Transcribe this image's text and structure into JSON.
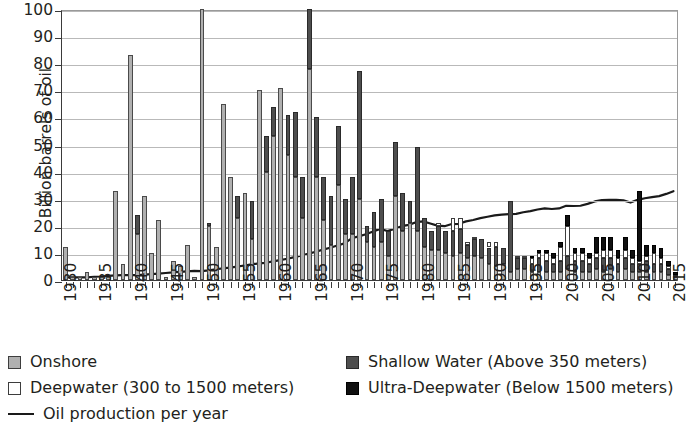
{
  "chart_data": {
    "type": "bar",
    "title": "",
    "subtitle": "",
    "xlabel": "",
    "ylabel": "Billion barrels of oil",
    "ylim": [
      0,
      100
    ],
    "ytick_values": [
      0,
      10,
      20,
      30,
      40,
      50,
      60,
      70,
      80,
      90,
      100
    ],
    "ytick_labels": [
      "0",
      "10",
      "20",
      "30",
      "40",
      "50",
      "60",
      "70",
      "80",
      "90",
      "100"
    ],
    "grid": true,
    "stacked": true,
    "legend_position": "below",
    "xtick_labels": [
      "1930",
      "1935",
      "1940",
      "1945",
      "1950",
      "1955",
      "1960",
      "1965",
      "1970",
      "1975",
      "1980",
      "1985",
      "1990",
      "1995",
      "2000",
      "2005",
      "2010",
      "2015"
    ],
    "x": [
      1930,
      1931,
      1932,
      1933,
      1934,
      1935,
      1936,
      1937,
      1938,
      1939,
      1940,
      1941,
      1942,
      1943,
      1944,
      1945,
      1946,
      1947,
      1948,
      1949,
      1950,
      1951,
      1952,
      1953,
      1954,
      1955,
      1956,
      1957,
      1958,
      1959,
      1960,
      1961,
      1962,
      1963,
      1964,
      1965,
      1966,
      1967,
      1968,
      1969,
      1970,
      1971,
      1972,
      1973,
      1974,
      1975,
      1976,
      1977,
      1978,
      1979,
      1980,
      1981,
      1982,
      1983,
      1984,
      1985,
      1986,
      1987,
      1988,
      1989,
      1990,
      1991,
      1992,
      1993,
      1994,
      1995,
      1996,
      1997,
      1998,
      1999,
      2000,
      2001,
      2002,
      2003,
      2004,
      2005,
      2006,
      2007,
      2008,
      2009,
      2010,
      2011,
      2012,
      2013,
      2014,
      2015
    ],
    "series": [
      {
        "name": "Onshore",
        "color": "#b0b0b0",
        "values": [
          12,
          1.5,
          1.5,
          3,
          1.5,
          1.5,
          1.5,
          33,
          6,
          83,
          24,
          31,
          10,
          22,
          6,
          12,
          5,
          100,
          20,
          11,
          65,
          38,
          31,
          30,
          70,
          56,
          71,
          60,
          62,
          50,
          38,
          58,
          38,
          100,
          78,
          60,
          36,
          30,
          57,
          30,
          25,
          77,
          20,
          19,
          35,
          29,
          40,
          26,
          28,
          49,
          22,
          13,
          18,
          12,
          15,
          12,
          11,
          14,
          11,
          14,
          11,
          12,
          8,
          7,
          5,
          5,
          5,
          5,
          4,
          5,
          6,
          5,
          5,
          5,
          6,
          5,
          5,
          5,
          5,
          5,
          5,
          5,
          4,
          4,
          3,
          2
        ]
      },
      {
        "name": "Shallow Water (Above 350 meters)",
        "color": "#4e4e4e",
        "values": [
          0,
          0,
          0,
          0,
          0,
          0,
          0,
          0,
          0,
          0,
          0,
          0,
          0,
          0,
          0,
          0,
          0,
          0,
          0,
          0,
          0,
          0,
          0,
          0,
          0,
          0,
          0,
          0,
          0,
          0,
          0,
          0,
          0,
          0,
          0,
          0,
          0,
          0,
          0,
          0,
          0,
          0,
          0,
          0,
          0,
          0,
          0,
          0,
          0,
          0,
          0,
          0,
          0,
          0,
          0,
          0,
          0,
          0,
          0,
          0,
          0,
          0,
          0,
          0,
          0,
          0,
          0,
          0,
          0,
          0,
          0,
          0,
          0,
          0,
          0,
          0,
          0,
          0,
          0,
          0,
          0,
          0,
          0,
          0,
          0,
          0
        ]
      }
    ],
    "stack_order": [
      "Onshore",
      "Shallow Water (Above 350 meters)",
      "Deepwater (300 to 1500 meters)",
      "Ultra-Deepwater (Below 1500 meters)"
    ],
    "bars": [
      {
        "year": 1930,
        "onshore": 12,
        "shallow": 0,
        "deepwater": 0,
        "ultra": 0
      },
      {
        "year": 1931,
        "onshore": 1,
        "shallow": 0,
        "deepwater": 0,
        "ultra": 0
      },
      {
        "year": 1932,
        "onshore": 1,
        "shallow": 0,
        "deepwater": 0,
        "ultra": 0
      },
      {
        "year": 1933,
        "onshore": 3,
        "shallow": 0,
        "deepwater": 0,
        "ultra": 0
      },
      {
        "year": 1934,
        "onshore": 1,
        "shallow": 0,
        "deepwater": 0,
        "ultra": 0
      },
      {
        "year": 1935,
        "onshore": 1,
        "shallow": 0,
        "deepwater": 0,
        "ultra": 0
      },
      {
        "year": 1936,
        "onshore": 1,
        "shallow": 0,
        "deepwater": 0,
        "ultra": 0
      },
      {
        "year": 1937,
        "onshore": 33,
        "shallow": 0,
        "deepwater": 0,
        "ultra": 0
      },
      {
        "year": 1938,
        "onshore": 6,
        "shallow": 0,
        "deepwater": 0,
        "ultra": 0
      },
      {
        "year": 1939,
        "onshore": 83,
        "shallow": 0,
        "deepwater": 0,
        "ultra": 0
      },
      {
        "year": 1940,
        "onshore": 17,
        "shallow": 7,
        "deepwater": 0,
        "ultra": 0
      },
      {
        "year": 1941,
        "onshore": 31,
        "shallow": 0,
        "deepwater": 0,
        "ultra": 0
      },
      {
        "year": 1942,
        "onshore": 10,
        "shallow": 0,
        "deepwater": 0,
        "ultra": 0
      },
      {
        "year": 1943,
        "onshore": 22,
        "shallow": 0,
        "deepwater": 0,
        "ultra": 0
      },
      {
        "year": 1944,
        "onshore": 1,
        "shallow": 0,
        "deepwater": 0,
        "ultra": 0
      },
      {
        "year": 1945,
        "onshore": 7,
        "shallow": 0,
        "deepwater": 0,
        "ultra": 0
      },
      {
        "year": 1946,
        "onshore": 5,
        "shallow": 0,
        "deepwater": 0,
        "ultra": 0
      },
      {
        "year": 1947,
        "onshore": 13,
        "shallow": 0,
        "deepwater": 0,
        "ultra": 0
      },
      {
        "year": 1948,
        "onshore": 1,
        "shallow": 0,
        "deepwater": 0,
        "ultra": 0
      },
      {
        "year": 1949,
        "onshore": 100,
        "shallow": 0,
        "deepwater": 0,
        "ultra": 0
      },
      {
        "year": 1950,
        "onshore": 20,
        "shallow": 1,
        "deepwater": 0,
        "ultra": 0
      },
      {
        "year": 1951,
        "onshore": 12,
        "shallow": 0,
        "deepwater": 0,
        "ultra": 0
      },
      {
        "year": 1952,
        "onshore": 65,
        "shallow": 0,
        "deepwater": 0,
        "ultra": 0
      },
      {
        "year": 1953,
        "onshore": 38,
        "shallow": 0,
        "deepwater": 0,
        "ultra": 0
      },
      {
        "year": 1954,
        "onshore": 23,
        "shallow": 8,
        "deepwater": 0,
        "ultra": 0
      },
      {
        "year": 1955,
        "onshore": 32,
        "shallow": 0,
        "deepwater": 0,
        "ultra": 0
      },
      {
        "year": 1956,
        "onshore": 15,
        "shallow": 14,
        "deepwater": 0,
        "ultra": 0
      },
      {
        "year": 1957,
        "onshore": 70,
        "shallow": 0,
        "deepwater": 0,
        "ultra": 0
      },
      {
        "year": 1958,
        "onshore": 40,
        "shallow": 13,
        "deepwater": 0,
        "ultra": 0
      },
      {
        "year": 1959,
        "onshore": 53,
        "shallow": 11,
        "deepwater": 0,
        "ultra": 0
      },
      {
        "year": 1960,
        "onshore": 71,
        "shallow": 0,
        "deepwater": 0,
        "ultra": 0
      },
      {
        "year": 1961,
        "onshore": 46,
        "shallow": 15,
        "deepwater": 0,
        "ultra": 0
      },
      {
        "year": 1962,
        "onshore": 38,
        "shallow": 24,
        "deepwater": 0,
        "ultra": 0
      },
      {
        "year": 1963,
        "onshore": 23,
        "shallow": 15,
        "deepwater": 0,
        "ultra": 0
      },
      {
        "year": 1964,
        "onshore": 78,
        "shallow": 22,
        "deepwater": 0,
        "ultra": 0
      },
      {
        "year": 1965,
        "onshore": 38,
        "shallow": 22,
        "deepwater": 0,
        "ultra": 0
      },
      {
        "year": 1966,
        "onshore": 22,
        "shallow": 16,
        "deepwater": 0,
        "ultra": 0
      },
      {
        "year": 1967,
        "onshore": 13,
        "shallow": 18,
        "deepwater": 0,
        "ultra": 0
      },
      {
        "year": 1968,
        "onshore": 35,
        "shallow": 22,
        "deepwater": 0,
        "ultra": 0
      },
      {
        "year": 1969,
        "onshore": 17,
        "shallow": 13,
        "deepwater": 0,
        "ultra": 0
      },
      {
        "year": 1970,
        "onshore": 17,
        "shallow": 21,
        "deepwater": 0,
        "ultra": 0
      },
      {
        "year": 1971,
        "onshore": 30,
        "shallow": 47,
        "deepwater": 0,
        "ultra": 0
      },
      {
        "year": 1972,
        "onshore": 14,
        "shallow": 6,
        "deepwater": 0,
        "ultra": 0
      },
      {
        "year": 1973,
        "onshore": 12,
        "shallow": 13,
        "deepwater": 0,
        "ultra": 0
      },
      {
        "year": 1974,
        "onshore": 14,
        "shallow": 16,
        "deepwater": 0,
        "ultra": 0
      },
      {
        "year": 1975,
        "onshore": 9,
        "shallow": 9,
        "deepwater": 0,
        "ultra": 0
      },
      {
        "year": 1976,
        "onshore": 31,
        "shallow": 20,
        "deepwater": 0,
        "ultra": 0
      },
      {
        "year": 1977,
        "onshore": 18,
        "shallow": 14,
        "deepwater": 0,
        "ultra": 0
      },
      {
        "year": 1978,
        "onshore": 21,
        "shallow": 8,
        "deepwater": 0,
        "ultra": 0
      },
      {
        "year": 1979,
        "onshore": 18,
        "shallow": 31,
        "deepwater": 0,
        "ultra": 0
      },
      {
        "year": 1980,
        "onshore": 12,
        "shallow": 11,
        "deepwater": 0,
        "ultra": 0
      },
      {
        "year": 1981,
        "onshore": 11,
        "shallow": 7,
        "deepwater": 0,
        "ultra": 0
      },
      {
        "year": 1982,
        "onshore": 11,
        "shallow": 9,
        "deepwater": 1,
        "ultra": 0
      },
      {
        "year": 1983,
        "onshore": 10,
        "shallow": 8,
        "deepwater": 0,
        "ultra": 0
      },
      {
        "year": 1984,
        "onshore": 9,
        "shallow": 9,
        "deepwater": 5,
        "ultra": 0
      },
      {
        "year": 1985,
        "onshore": 10,
        "shallow": 9,
        "deepwater": 4,
        "ultra": 0
      },
      {
        "year": 1986,
        "onshore": 8,
        "shallow": 5,
        "deepwater": 1,
        "ultra": 0
      },
      {
        "year": 1987,
        "onshore": 9,
        "shallow": 6,
        "deepwater": 1,
        "ultra": 0
      },
      {
        "year": 1988,
        "onshore": 8,
        "shallow": 7,
        "deepwater": 0,
        "ultra": 0
      },
      {
        "year": 1989,
        "onshore": 6,
        "shallow": 6,
        "deepwater": 2,
        "ultra": 0
      },
      {
        "year": 1990,
        "onshore": 5,
        "shallow": 7,
        "deepwater": 2,
        "ultra": 0
      },
      {
        "year": 1991,
        "onshore": 6,
        "shallow": 6,
        "deepwater": 0,
        "ultra": 0
      },
      {
        "year": 1992,
        "onshore": 3,
        "shallow": 26,
        "deepwater": 0,
        "ultra": 0
      },
      {
        "year": 1993,
        "onshore": 4,
        "shallow": 4,
        "deepwater": 1,
        "ultra": 0
      },
      {
        "year": 1994,
        "onshore": 4,
        "shallow": 4,
        "deepwater": 1,
        "ultra": 0
      },
      {
        "year": 1995,
        "onshore": 3,
        "shallow": 3,
        "deepwater": 2,
        "ultra": 1
      },
      {
        "year": 1996,
        "onshore": 3,
        "shallow": 5,
        "deepwater": 2,
        "ultra": 1
      },
      {
        "year": 1997,
        "onshore": 3,
        "shallow": 4,
        "deepwater": 3,
        "ultra": 1
      },
      {
        "year": 1998,
        "onshore": 3,
        "shallow": 3,
        "deepwater": 2,
        "ultra": 2
      },
      {
        "year": 1999,
        "onshore": 3,
        "shallow": 4,
        "deepwater": 5,
        "ultra": 2
      },
      {
        "year": 2000,
        "onshore": 4,
        "shallow": 5,
        "deepwater": 11,
        "ultra": 4
      },
      {
        "year": 2001,
        "onshore": 3,
        "shallow": 4,
        "deepwater": 3,
        "ultra": 2
      },
      {
        "year": 2002,
        "onshore": 3,
        "shallow": 4,
        "deepwater": 3,
        "ultra": 2
      },
      {
        "year": 2003,
        "onshore": 3,
        "shallow": 3,
        "deepwater": 2,
        "ultra": 2
      },
      {
        "year": 2004,
        "onshore": 4,
        "shallow": 4,
        "deepwater": 2,
        "ultra": 6
      },
      {
        "year": 2005,
        "onshore": 3,
        "shallow": 5,
        "deepwater": 3,
        "ultra": 5
      },
      {
        "year": 2006,
        "onshore": 4,
        "shallow": 4,
        "deepwater": 3,
        "ultra": 5
      },
      {
        "year": 2007,
        "onshore": 3,
        "shallow": 3,
        "deepwater": 2,
        "ultra": 3
      },
      {
        "year": 2008,
        "onshore": 4,
        "shallow": 4,
        "deepwater": 3,
        "ultra": 5
      },
      {
        "year": 2009,
        "onshore": 3,
        "shallow": 3,
        "deepwater": 2,
        "ultra": 3
      },
      {
        "year": 2010,
        "onshore": 3,
        "shallow": 3,
        "deepwater": 1,
        "ultra": 26
      },
      {
        "year": 2011,
        "onshore": 3,
        "shallow": 4,
        "deepwater": 2,
        "ultra": 4
      },
      {
        "year": 2012,
        "onshore": 3,
        "shallow": 3,
        "deepwater": 4,
        "ultra": 3
      },
      {
        "year": 2013,
        "onshore": 3,
        "shallow": 3,
        "deepwater": 2,
        "ultra": 4
      },
      {
        "year": 2014,
        "onshore": 2,
        "shallow": 2,
        "deepwater": 1,
        "ultra": 2
      },
      {
        "year": 2015,
        "onshore": 1,
        "shallow": 1,
        "deepwater": 0,
        "ultra": 1
      }
    ],
    "line_series": {
      "name": "Oil production per year",
      "color": "#1a1a1a",
      "values": [
        1,
        1,
        1,
        1,
        1.2,
        1.3,
        1.5,
        1.7,
        1.8,
        1.8,
        1.8,
        2,
        2.2,
        2.4,
        2.6,
        2.8,
        3,
        3.2,
        3.4,
        3.3,
        3.6,
        4,
        4.3,
        4.6,
        5,
        5.4,
        5.8,
        6.2,
        6.4,
        6.9,
        7.4,
        7.9,
        8.5,
        9.1,
        9.8,
        10.5,
        11.3,
        12,
        12.8,
        13.6,
        15.5,
        16.2,
        17,
        18,
        19,
        18.2,
        19,
        20,
        20.5,
        21.5,
        21.8,
        21,
        20.2,
        20,
        20.8,
        20.9,
        21.8,
        22.3,
        23,
        23.5,
        24,
        24.3,
        24.5,
        24.6,
        25.2,
        25.6,
        26.2,
        26.6,
        26.4,
        26.6,
        27.6,
        27.5,
        27.6,
        28.3,
        29.2,
        29.7,
        29.8,
        29.8,
        29.6,
        28.8,
        29.8,
        30.4,
        30.8,
        31.2,
        32,
        33
      ]
    }
  },
  "legend": {
    "items": [
      {
        "label": "Onshore",
        "swatch": "onshore"
      },
      {
        "label": "Shallow Water (Above 350 meters)",
        "swatch": "shallow"
      },
      {
        "label": "Deepwater (300 to 1500 meters)",
        "swatch": "deep"
      },
      {
        "label": "Ultra-Deepwater (Below 1500 meters)",
        "swatch": "ultra"
      },
      {
        "label": "Oil production per year",
        "swatch": "line"
      }
    ]
  }
}
